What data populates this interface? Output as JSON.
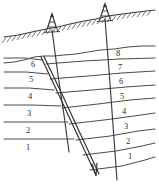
{
  "figure": {
    "type": "cross-section-diagram",
    "width": 159,
    "height": 184,
    "background_color": "#ffffff",
    "line_color": "#4a4a4a"
  },
  "ground_surface": {
    "name": "ground-surface",
    "hatched": true,
    "hatch_side": "below",
    "path": "M 4,37 L 30,32 L 56,26 L 78,22 L 104,17 L 128,13 L 155,10"
  },
  "unconformity": {
    "name": "unconformity-surface",
    "path": "M 4,63 L 22,61 L 40,57 L 58,55 L 76,54 L 94,51 L 116,49 L 136,47 L 155,46"
  },
  "rigs": [
    {
      "id": "rig-left",
      "name": "drilling-rig-left",
      "x": 52,
      "y": 28,
      "label": ""
    },
    {
      "id": "rig-right",
      "name": "drilling-rig-right",
      "x": 105,
      "y": 17,
      "label": ""
    }
  ],
  "wells": [
    {
      "id": "well-left",
      "name": "well-bore-left",
      "x1": 52,
      "y1": 30,
      "x2": 69,
      "y2": 152
    },
    {
      "id": "well-right",
      "name": "well-bore-right",
      "x1": 105,
      "y1": 19,
      "x2": 117,
      "y2": 180
    }
  ],
  "fault": {
    "name": "fault-plane",
    "label": "normal fault",
    "x1": 41,
    "y1": 57,
    "x2": 97,
    "y2": 176,
    "offset": 2.2,
    "arrow": true,
    "arrow_direction": "down-dip"
  },
  "left_block": {
    "name": "footwall-block",
    "layer_labels": [
      "6",
      "5",
      "4",
      "3",
      "2",
      "1"
    ],
    "label_x": 33,
    "label_y": [
      63,
      79,
      95,
      113,
      131,
      148
    ],
    "boundaries": [
      "M 4,58 L 43,60",
      "M 4,72 L 48,74",
      "M 4,88 L 54,90",
      "M 4,105 L 61,106",
      "M 4,122 L 68,122",
      "M 4,139 L 74,139"
    ]
  },
  "right_block": {
    "name": "hangingwall-block",
    "layer_labels": [
      "8",
      "7",
      "6",
      "5",
      "4",
      "3",
      "2",
      "1"
    ],
    "label_x": 120,
    "label_y": [
      56,
      72,
      87,
      101,
      118,
      135,
      149,
      164
    ],
    "boundaries": [
      "M 46,64 L 155,58",
      "M 50,79 L 155,71",
      "M 56,93 L 155,85",
      "M 62,108 L 155,98",
      "M 69,124 L 155,113",
      "M 76,140 L 155,129",
      "M 83,155 L 155,143",
      "M 90,170 L 155,157"
    ]
  },
  "colors": {
    "line": "#4a4a4a",
    "fault": "#2e2e2e",
    "text": "#2b2b2b",
    "background": "#ffffff"
  }
}
